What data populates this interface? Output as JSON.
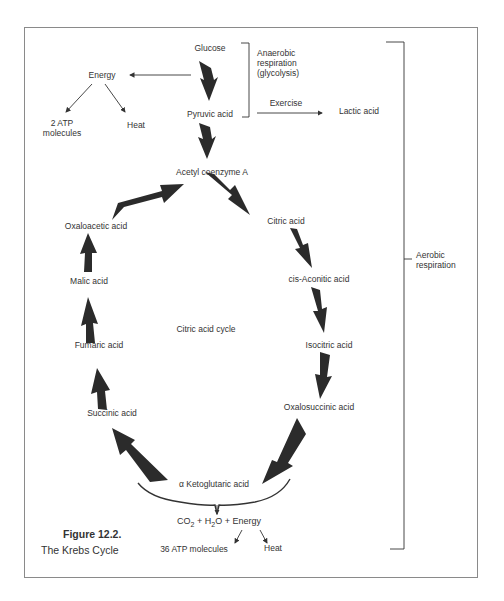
{
  "figure": {
    "number": "Figure 12.2.",
    "title": "The Krebs Cycle"
  },
  "glycolysis": {
    "glucose": "Glucose",
    "pyruvic_acid": "Pyruvic acid",
    "bracket_label_line1": "Anaerobic",
    "bracket_label_line2": "respiration",
    "bracket_label_line3": "(glycolysis)",
    "energy": "Energy",
    "atp_line1": "2 ATP",
    "atp_line2": "molecules",
    "heat": "Heat",
    "exercise": "Exercise",
    "lactic_acid": "Lactic acid"
  },
  "cycle": {
    "acetyl_coa": "Acetyl coenzyme A",
    "center_label": "Citric acid cycle",
    "steps": [
      "Citric acid",
      "cis-Aconitic acid",
      "Isocitric acid",
      "Oxalosuccinic acid",
      "α Ketoglutaric acid",
      "Succinic acid",
      "Fumaric acid",
      "Malic acid",
      "Oxaloacetic acid"
    ]
  },
  "products": {
    "equation_co2": "CO",
    "equation_co2_sub": "2",
    "equation_h2o_pre": " + H",
    "equation_h2o_sub": "2",
    "equation_rest": "O + Energy",
    "atp": "36 ATP molecules",
    "heat": "Heat"
  },
  "aerobic": {
    "line1": "Aerobic",
    "line2": "respiration"
  }
}
